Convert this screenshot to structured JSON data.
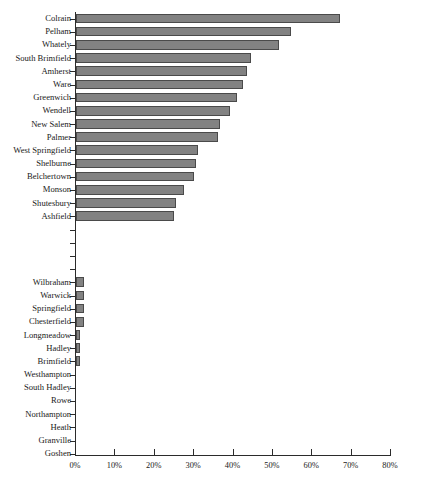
{
  "chart_data": {
    "type": "bar",
    "orientation": "horizontal",
    "title": "",
    "xlabel": "",
    "ylabel": "",
    "xlim": [
      0,
      80
    ],
    "xtick_labels": [
      "0%",
      "10%",
      "20%",
      "30%",
      "40%",
      "50%",
      "60%",
      "70%",
      "80%"
    ],
    "xtick_values": [
      0,
      10,
      20,
      30,
      40,
      50,
      60,
      70,
      80
    ],
    "grid": false,
    "legend": null,
    "bar_color": "#828282",
    "bar_edge_color": "#4a4a4a",
    "categories": [
      "Colrain",
      "Pelham",
      "Whately",
      "South Brimfield",
      "Amherst",
      "Ware",
      "Greenwich",
      "Wendell",
      "New Salem",
      "Palmer",
      "West Springfield",
      "Shelburne",
      "Belchertown",
      "Monson",
      "Shutesbury",
      "Ashfield",
      "",
      "",
      "",
      "",
      "Wilbraham",
      "Warwick",
      "Springfield",
      "Chesterfield",
      "Longmeadow",
      "Hadley",
      "Brimfield",
      "Westhampton",
      "South Hadley",
      "Rowe",
      "Northampton",
      "Heath",
      "Granville",
      "Goshen"
    ],
    "values": [
      67.0,
      54.5,
      51.5,
      44.5,
      43.5,
      42.5,
      41.0,
      39.0,
      36.5,
      36.0,
      31.0,
      30.5,
      30.0,
      27.5,
      25.5,
      25.0,
      null,
      null,
      null,
      null,
      2.0,
      2.0,
      2.0,
      2.0,
      1.0,
      1.0,
      1.0,
      0,
      0,
      0,
      0,
      0,
      0,
      0
    ]
  },
  "caption": {
    "text": ""
  }
}
